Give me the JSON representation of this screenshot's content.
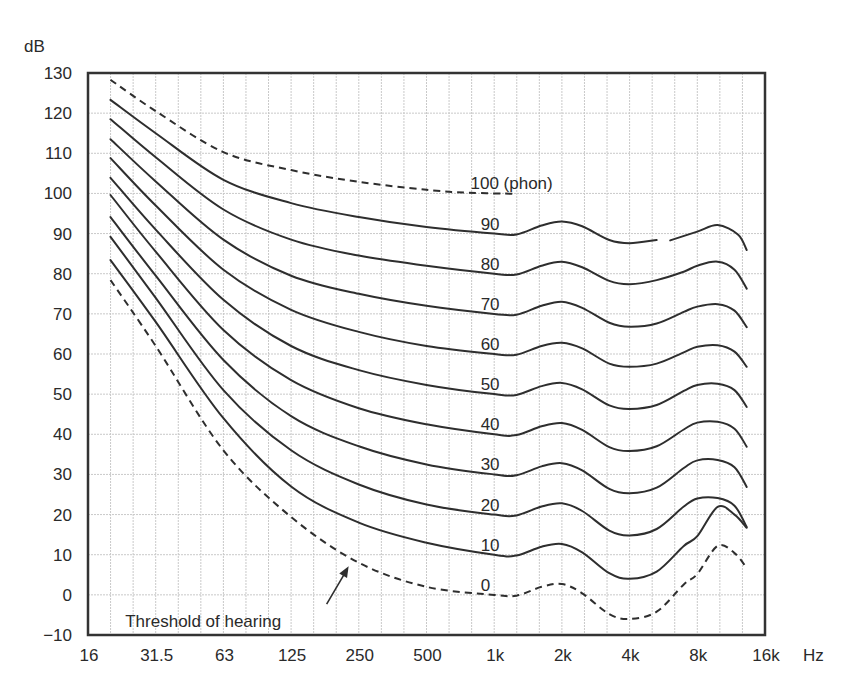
{
  "chart_data": {
    "type": "line",
    "title": "",
    "xlabel": "Hz",
    "ylabel": "dB",
    "x_scale": "log2 (octaves)",
    "x_ticks": [
      {
        "label": "16",
        "octave": 0
      },
      {
        "label": "31.5",
        "octave": 1
      },
      {
        "label": "63",
        "octave": 2
      },
      {
        "label": "125",
        "octave": 3
      },
      {
        "label": "250",
        "octave": 4
      },
      {
        "label": "500",
        "octave": 5
      },
      {
        "label": "1k",
        "octave": 6
      },
      {
        "label": "2k",
        "octave": 7
      },
      {
        "label": "4k",
        "octave": 8
      },
      {
        "label": "8k",
        "octave": 9
      },
      {
        "label": "16k",
        "octave": 10
      }
    ],
    "y_ticks": [
      "130",
      "120",
      "110",
      "100",
      "90",
      "80",
      "70",
      "60",
      "50",
      "40",
      "30",
      "20",
      "10",
      "0",
      "−10"
    ],
    "y_tick_values": [
      130,
      120,
      110,
      100,
      90,
      80,
      70,
      60,
      50,
      40,
      30,
      20,
      10,
      0,
      -10
    ],
    "ylim": [
      -10,
      130
    ],
    "xlim_octaves": [
      0,
      10
    ],
    "grid": {
      "horizontal_step_db": 10,
      "vertical_step_octave": 0.3333
    },
    "series": [
      {
        "name": "100 (phon)",
        "label": "100 (phon)",
        "style": "dashed",
        "label_octave": 5.65,
        "label_db": 102.5,
        "points": [
          [
            0.333,
            128.3
          ],
          [
            1,
            120.5
          ],
          [
            2,
            110.3
          ],
          [
            3,
            105.8
          ],
          [
            4,
            102.9
          ],
          [
            5,
            100.9
          ],
          [
            5.6,
            100.2
          ],
          [
            6.3,
            99.9
          ]
        ]
      },
      {
        "name": "90 phon",
        "label": "90",
        "style": "solid",
        "label_octave": 5.8,
        "label_db": 92.5,
        "points": [
          [
            0.333,
            123.3
          ],
          [
            1,
            115
          ],
          [
            2,
            103.4
          ],
          [
            3,
            97.6
          ],
          [
            4,
            94.1
          ],
          [
            5,
            91.6
          ],
          [
            6,
            90
          ],
          [
            6.33,
            89.8
          ],
          [
            6.7,
            92
          ],
          [
            7,
            93
          ],
          [
            7.3,
            91.8
          ],
          [
            7.7,
            88.4
          ],
          [
            8,
            87.6
          ],
          [
            8.4,
            88.4
          ]
        ],
        "points_segment2": [
          [
            8.6,
            88.3
          ],
          [
            9,
            90.5
          ],
          [
            9.3,
            92.1
          ],
          [
            9.6,
            89.8
          ],
          [
            9.73,
            85.9
          ]
        ]
      },
      {
        "name": "80 phon",
        "label": "80",
        "style": "solid",
        "label_octave": 5.8,
        "label_db": 82.5,
        "points": [
          [
            0.333,
            118.5
          ],
          [
            1,
            109
          ],
          [
            2,
            96
          ],
          [
            3,
            88.5
          ],
          [
            4,
            84.5
          ],
          [
            5,
            82
          ],
          [
            6,
            80
          ],
          [
            6.33,
            79.8
          ],
          [
            6.7,
            82
          ],
          [
            7,
            83
          ],
          [
            7.3,
            81.6
          ],
          [
            7.7,
            78.2
          ],
          [
            8,
            77.4
          ],
          [
            8.4,
            78.4
          ],
          [
            8.8,
            80.5
          ],
          [
            9,
            82
          ],
          [
            9.3,
            83
          ],
          [
            9.55,
            81
          ],
          [
            9.73,
            76.3
          ]
        ]
      },
      {
        "name": "70 phon",
        "label": "70",
        "style": "solid",
        "label_octave": 5.8,
        "label_db": 72.5,
        "points": [
          [
            0.333,
            113.5
          ],
          [
            1,
            103
          ],
          [
            2,
            88.5
          ],
          [
            3,
            79.5
          ],
          [
            4,
            75
          ],
          [
            5,
            72
          ],
          [
            6,
            70
          ],
          [
            6.33,
            69.8
          ],
          [
            6.7,
            72
          ],
          [
            7,
            73
          ],
          [
            7.3,
            71.5
          ],
          [
            7.7,
            67.8
          ],
          [
            8,
            66.8
          ],
          [
            8.4,
            67.6
          ],
          [
            8.8,
            70.5
          ],
          [
            9,
            71.8
          ],
          [
            9.3,
            72.4
          ],
          [
            9.55,
            70.8
          ],
          [
            9.73,
            66.7
          ]
        ]
      },
      {
        "name": "60 phon",
        "label": "60",
        "style": "solid",
        "label_octave": 5.8,
        "label_db": 62.5,
        "points": [
          [
            0.333,
            108.8
          ],
          [
            1,
            97
          ],
          [
            2,
            81
          ],
          [
            3,
            71
          ],
          [
            4,
            65.5
          ],
          [
            5,
            62
          ],
          [
            6,
            60
          ],
          [
            6.33,
            59.8
          ],
          [
            6.7,
            62
          ],
          [
            7,
            62.8
          ],
          [
            7.3,
            61.4
          ],
          [
            7.7,
            57.6
          ],
          [
            8,
            56.8
          ],
          [
            8.4,
            57.6
          ],
          [
            8.8,
            60.4
          ],
          [
            9,
            61.8
          ],
          [
            9.3,
            62.2
          ],
          [
            9.55,
            60.6
          ],
          [
            9.73,
            56.8
          ]
        ]
      },
      {
        "name": "50 phon",
        "label": "50",
        "style": "solid",
        "label_octave": 5.8,
        "label_db": 52.5,
        "points": [
          [
            0.333,
            103.9
          ],
          [
            1,
            91
          ],
          [
            2,
            73.5
          ],
          [
            3,
            62
          ],
          [
            4,
            56
          ],
          [
            5,
            52.3
          ],
          [
            6,
            50
          ],
          [
            6.33,
            49.8
          ],
          [
            6.7,
            52
          ],
          [
            7,
            52.8
          ],
          [
            7.3,
            51.2
          ],
          [
            7.7,
            47.2
          ],
          [
            8,
            46.3
          ],
          [
            8.4,
            47.3
          ],
          [
            8.8,
            50.8
          ],
          [
            9,
            52.3
          ],
          [
            9.3,
            52.6
          ],
          [
            9.55,
            51
          ],
          [
            9.73,
            46.8
          ]
        ]
      },
      {
        "name": "40 phon",
        "label": "40",
        "style": "solid",
        "label_octave": 5.8,
        "label_db": 42.5,
        "points": [
          [
            0.333,
            99.6
          ],
          [
            1,
            85.5
          ],
          [
            2,
            66
          ],
          [
            3,
            53.5
          ],
          [
            4,
            46.5
          ],
          [
            5,
            42.5
          ],
          [
            6,
            40
          ],
          [
            6.33,
            39.8
          ],
          [
            6.7,
            42
          ],
          [
            7,
            42.8
          ],
          [
            7.3,
            41.1
          ],
          [
            7.7,
            36.8
          ],
          [
            8,
            35.8
          ],
          [
            8.4,
            37
          ],
          [
            8.8,
            41.2
          ],
          [
            9,
            42.9
          ],
          [
            9.3,
            43.1
          ],
          [
            9.55,
            41.4
          ],
          [
            9.73,
            36.9
          ]
        ]
      },
      {
        "name": "30 phon",
        "label": "30",
        "style": "solid",
        "label_octave": 5.8,
        "label_db": 32.5,
        "points": [
          [
            0.333,
            94.1
          ],
          [
            1,
            79.5
          ],
          [
            2,
            58.5
          ],
          [
            3,
            44.5
          ],
          [
            4,
            37
          ],
          [
            5,
            32.5
          ],
          [
            6,
            30
          ],
          [
            6.33,
            29.8
          ],
          [
            6.7,
            32
          ],
          [
            7,
            32.8
          ],
          [
            7.3,
            31
          ],
          [
            7.7,
            26.4
          ],
          [
            8,
            25.3
          ],
          [
            8.4,
            26.7
          ],
          [
            8.8,
            31.6
          ],
          [
            9,
            33.5
          ],
          [
            9.3,
            33.6
          ],
          [
            9.55,
            31.8
          ],
          [
            9.73,
            26.9
          ]
        ]
      },
      {
        "name": "20 phon",
        "label": "20",
        "style": "solid",
        "label_octave": 5.8,
        "label_db": 22.5,
        "points": [
          [
            0.333,
            89.2
          ],
          [
            1,
            74
          ],
          [
            2,
            51
          ],
          [
            3,
            36
          ],
          [
            4,
            27.5
          ],
          [
            5,
            22.5
          ],
          [
            6,
            20
          ],
          [
            6.33,
            19.8
          ],
          [
            6.7,
            22
          ],
          [
            7,
            22.8
          ],
          [
            7.3,
            20.9
          ],
          [
            7.7,
            16
          ],
          [
            8,
            14.8
          ],
          [
            8.4,
            16.4
          ],
          [
            8.8,
            22
          ],
          [
            9,
            24
          ],
          [
            9.3,
            24.1
          ],
          [
            9.55,
            22.2
          ],
          [
            9.73,
            16.9
          ]
        ]
      },
      {
        "name": "10 phon",
        "label": "10",
        "style": "solid",
        "label_octave": 5.8,
        "label_db": 12.5,
        "points": [
          [
            0.333,
            83.4
          ],
          [
            1,
            68
          ],
          [
            2,
            44
          ],
          [
            3,
            27
          ],
          [
            4,
            18
          ],
          [
            5,
            13
          ],
          [
            6,
            10
          ],
          [
            6.33,
            9.8
          ],
          [
            6.7,
            12
          ],
          [
            7,
            12.7
          ],
          [
            7.3,
            10.6
          ],
          [
            7.7,
            5.4
          ],
          [
            8,
            4
          ],
          [
            8.4,
            5.8
          ],
          [
            8.8,
            12.2
          ],
          [
            9,
            14.6
          ],
          [
            9.3,
            21.9
          ],
          [
            9.55,
            20
          ],
          [
            9.73,
            16.7
          ]
        ]
      },
      {
        "name": "0 phon (Threshold of hearing)",
        "label": "0",
        "style": "dashed",
        "label_octave": 5.8,
        "label_db": 2.5,
        "points": [
          [
            0.333,
            78.4
          ],
          [
            1,
            62
          ],
          [
            2,
            36
          ],
          [
            3,
            19.4
          ],
          [
            4,
            8
          ],
          [
            5,
            2
          ],
          [
            6,
            0
          ],
          [
            6.33,
            -0.2
          ],
          [
            6.7,
            2
          ],
          [
            7,
            2.7
          ],
          [
            7.3,
            0.4
          ],
          [
            7.7,
            -4.8
          ],
          [
            8,
            -6
          ],
          [
            8.4,
            -4.2
          ],
          [
            8.8,
            2.6
          ],
          [
            9,
            5.2
          ],
          [
            9.3,
            12.2
          ],
          [
            9.55,
            10.4
          ],
          [
            9.73,
            6.7
          ]
        ]
      }
    ],
    "annotations": [
      {
        "text": "Threshold of hearing",
        "arrow_to_octave": 3.85,
        "arrow_to_db": 7.9,
        "text_octave": 0.55,
        "text_db": -6.5
      }
    ]
  }
}
